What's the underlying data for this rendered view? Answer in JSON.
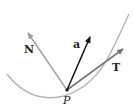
{
  "diagram": {
    "type": "vector-diagram",
    "labels": {
      "normal": "N",
      "acceleration": "a",
      "tangent": "T",
      "point": "P"
    },
    "colors": {
      "curve": "#b0b0b0",
      "normal_vector": "#a0a0a0",
      "acceleration_vector": "#111111",
      "tangent_vector": "#777777",
      "point": "#111111"
    },
    "geometry": {
      "point_P": [
        67,
        90
      ],
      "N_tip": [
        28,
        33
      ],
      "a_tip": [
        90,
        37
      ],
      "T_tip": [
        123,
        49
      ]
    }
  }
}
